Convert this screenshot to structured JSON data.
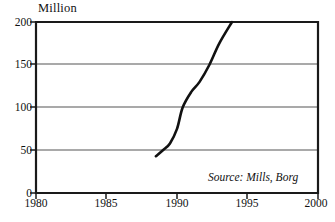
{
  "chart_data": {
    "type": "line",
    "title": "",
    "subtitle": "",
    "ylabel": "Million",
    "xlabel": "",
    "xlim": [
      1980,
      2000
    ],
    "ylim": [
      0,
      200
    ],
    "grid": true,
    "legend": false,
    "legend_position": "none",
    "xticks": [
      1980,
      1985,
      1990,
      1995,
      2000
    ],
    "xtick_labels": [
      "1980",
      "1985",
      "1990",
      "1995",
      "2000"
    ],
    "yticks": [
      0,
      50,
      100,
      150,
      200
    ],
    "ytick_labels": [
      "0",
      "50",
      "100",
      "150",
      "200"
    ],
    "gridlines_y": [
      50,
      100,
      150,
      200
    ],
    "annotations": [
      {
        "name": "source-note",
        "text": "Source: Mills, Borg",
        "style": "italic",
        "position": "bottom-right-inside-plot"
      }
    ],
    "series": [
      {
        "name": "million",
        "color": "#111111",
        "line_width": 2.6,
        "clipped_at_top": true,
        "x": [
          1988.5,
          1989.0,
          1989.5,
          1990.0,
          1990.4,
          1991.0,
          1991.6,
          1992.3,
          1993.0,
          1993.9
        ],
        "values": [
          43,
          50,
          58,
          75,
          100,
          118,
          130,
          150,
          175,
          200
        ]
      }
    ]
  },
  "axis": {
    "unit_label": "Million"
  },
  "xaxis": {
    "labels": [
      "1980",
      "1985",
      "1990",
      "1995",
      "2000"
    ]
  },
  "yaxis": {
    "labels": [
      "200",
      "150",
      "100",
      "50",
      "0"
    ]
  },
  "notes": {
    "source": "Source: Mills, Borg"
  },
  "colors": {
    "line": "#111111",
    "frame": "#1a1a1a",
    "gridline": "#555555",
    "background": "#ffffff",
    "text": "#111111"
  }
}
